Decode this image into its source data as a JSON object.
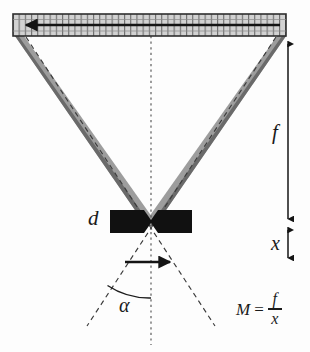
{
  "figure": {
    "type": "technical-schematic",
    "labels": {
      "d": "d",
      "f": "f",
      "x": "x",
      "alpha": "α"
    },
    "equation": {
      "lhs": "M",
      "operator": "=",
      "numerator": "f",
      "denominator": "x",
      "full": "M = f / x"
    },
    "colors": {
      "beam_fill": "#9a9a9a",
      "beam_edge": "#6e6e6e",
      "bar_fill": "#d0d0d0",
      "bar_edge": "#3a3a3a",
      "ink": "#1a1a1a",
      "dash": "#3d3d3d",
      "background": "#fdfdfd"
    },
    "geometry": {
      "hatched_bar": {
        "x1": 13,
        "y1": 14,
        "x2": 286,
        "y2": 36,
        "grid_divisions": 44
      },
      "bar_arrow": {
        "from_x": 280,
        "to_x": 22,
        "y": 25,
        "direction": "left"
      },
      "crossing_point": {
        "x": 151,
        "y": 222
      },
      "left_beam": {
        "top_x": 20,
        "top_y": 36,
        "bottom_x": 145,
        "bottom_y": 216
      },
      "right_beam": {
        "top_x": 280,
        "top_y": 36,
        "bottom_x": 157,
        "bottom_y": 216
      },
      "centerline": {
        "x": 151,
        "y_top": 36,
        "y_bottom": 345
      },
      "dimension_f": {
        "x": 288,
        "y_top": 40,
        "y_bottom": 222
      },
      "dimension_x": {
        "x": 288,
        "y_top": 226,
        "y_bottom": 262
      },
      "center_arrow": {
        "from_x": 125,
        "to_x": 177,
        "y": 262,
        "direction": "right"
      },
      "angle_arc": {
        "vertex_x": 151,
        "vertex_y": 222,
        "radius": 76,
        "label": "α"
      }
    },
    "elements": {
      "hatched_bar_name": "hatched-sensor-bar",
      "left_beam_name": "left-ray-beam",
      "right_beam_name": "right-ray-beam",
      "left_wedge_name": "left-black-wedge",
      "right_wedge_name": "right-black-wedge"
    }
  }
}
